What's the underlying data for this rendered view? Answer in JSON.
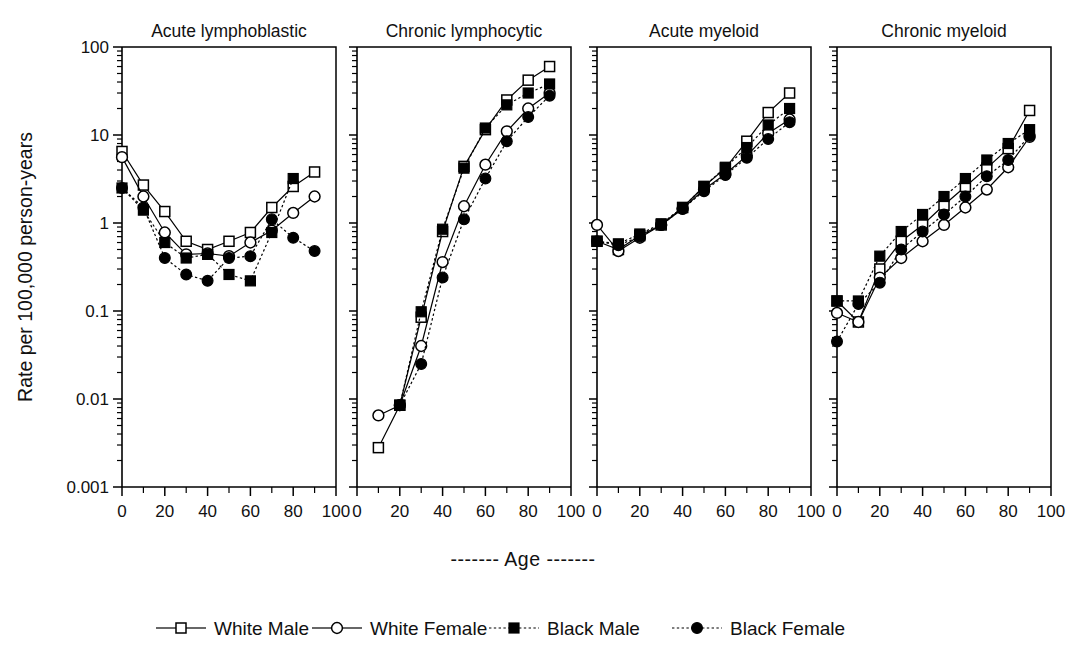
{
  "figure": {
    "y_axis_title": "Rate per 100,000 person-years",
    "x_axis_title": "-------  Age  -------",
    "x_axis_title_plain": "Age"
  },
  "legend": {
    "position": "bottom",
    "items": [
      {
        "label": "White Male",
        "marker": "open-square",
        "line": "solid"
      },
      {
        "label": "White Female",
        "marker": "open-circle",
        "line": "solid"
      },
      {
        "label": "Black Male",
        "marker": "filled-square",
        "line": "dotted"
      },
      {
        "label": "Black Female",
        "marker": "filled-circle",
        "line": "dotted"
      }
    ]
  },
  "axes": {
    "y_tick_labels": [
      "100",
      "10",
      "1",
      "0.1",
      "0.01",
      "0.001"
    ],
    "y_tick_values": [
      100,
      10,
      1,
      0.1,
      0.01,
      0.001
    ],
    "y_scale": "log",
    "ylim": [
      0.001,
      100
    ],
    "x_tick_labels": [
      "0",
      "20",
      "40",
      "60",
      "80",
      "100"
    ],
    "x_tick_values": [
      0,
      20,
      40,
      60,
      80,
      100
    ],
    "x_minor_step": 10,
    "xlim": [
      0,
      100
    ],
    "grid": false
  },
  "chart_data": {
    "type": "line",
    "title": "",
    "subtitle": "",
    "xlabel": "Age",
    "ylabel": "Rate per 100,000 person-years",
    "yscale": "log",
    "ylim": [
      0.001,
      100
    ],
    "xlim": [
      0,
      100
    ],
    "grid": false,
    "legend_position": "bottom",
    "legend_entries": [
      "White Male",
      "White Female",
      "Black Male",
      "Black Female"
    ],
    "x": [
      0,
      10,
      20,
      30,
      40,
      50,
      60,
      70,
      80,
      90
    ],
    "panels": [
      {
        "title": "Acute lymphoblastic",
        "series": [
          {
            "name": "White Male",
            "marker": "open-square",
            "line": "solid",
            "values": [
              6.5,
              2.7,
              1.35,
              0.62,
              0.5,
              0.62,
              0.78,
              1.5,
              2.6,
              3.8
            ]
          },
          {
            "name": "White Female",
            "marker": "open-circle",
            "line": "solid",
            "values": [
              5.6,
              2.0,
              0.78,
              0.44,
              0.45,
              0.42,
              0.6,
              0.82,
              1.3,
              2.0
            ]
          },
          {
            "name": "Black Male",
            "marker": "filled-square",
            "line": "dotted",
            "values": [
              2.5,
              1.4,
              0.6,
              0.4,
              0.44,
              0.26,
              0.22,
              0.78,
              3.2,
              null
            ]
          },
          {
            "name": "Black Female",
            "marker": "filled-circle",
            "line": "dotted",
            "values": [
              2.5,
              1.5,
              0.4,
              0.26,
              0.22,
              0.4,
              0.42,
              1.1,
              0.68,
              0.48
            ]
          }
        ]
      },
      {
        "title": "Chronic lymphocytic",
        "series": [
          {
            "name": "White Male",
            "marker": "open-square",
            "line": "solid",
            "values": [
              null,
              0.0028,
              0.0085,
              0.085,
              0.8,
              4.4,
              11.5,
              25,
              42,
              60
            ]
          },
          {
            "name": "White Female",
            "marker": "open-circle",
            "line": "solid",
            "values": [
              null,
              0.0065,
              0.0085,
              0.04,
              0.36,
              1.55,
              4.6,
              11,
              20,
              30
            ]
          },
          {
            "name": "Black Male",
            "marker": "filled-square",
            "line": "dotted",
            "values": [
              null,
              null,
              0.0085,
              0.098,
              0.85,
              4.2,
              12,
              22,
              30,
              38
            ]
          },
          {
            "name": "Black Female",
            "marker": "filled-circle",
            "line": "dotted",
            "values": [
              null,
              null,
              0.0085,
              0.025,
              0.24,
              1.1,
              3.2,
              8.5,
              16,
              28
            ]
          }
        ]
      },
      {
        "title": "Acute myeloid",
        "series": [
          {
            "name": "White Male",
            "marker": "open-square",
            "line": "solid",
            "values": [
              0.62,
              0.5,
              0.72,
              0.95,
              1.5,
              2.6,
              4.2,
              8.5,
              18,
              30
            ]
          },
          {
            "name": "White Female",
            "marker": "open-circle",
            "line": "solid",
            "values": [
              0.95,
              0.48,
              0.68,
              0.95,
              1.45,
              2.4,
              3.6,
              5.8,
              10.5,
              15
            ]
          },
          {
            "name": "Black Male",
            "marker": "filled-square",
            "line": "dotted",
            "values": [
              0.62,
              0.58,
              0.75,
              0.98,
              1.5,
              2.6,
              4.3,
              7.2,
              13,
              20
            ]
          },
          {
            "name": "Black Female",
            "marker": "filled-circle",
            "line": "dotted",
            "values": [
              0.62,
              0.56,
              0.7,
              0.95,
              1.45,
              2.3,
              3.5,
              5.5,
              9.0,
              14
            ]
          }
        ]
      },
      {
        "title": "Chronic myeloid",
        "series": [
          {
            "name": "White Male",
            "marker": "open-square",
            "line": "solid",
            "values": [
              0.13,
              0.075,
              0.3,
              0.62,
              0.95,
              1.6,
              2.6,
              4.2,
              7.0,
              19
            ]
          },
          {
            "name": "White Female",
            "marker": "open-circle",
            "line": "solid",
            "values": [
              0.095,
              0.075,
              0.24,
              0.4,
              0.62,
              0.95,
              1.5,
              2.4,
              4.3,
              9.5
            ]
          },
          {
            "name": "Black Male",
            "marker": "filled-square",
            "line": "dotted",
            "values": [
              0.13,
              0.13,
              0.42,
              0.8,
              1.25,
              2.0,
              3.2,
              5.2,
              8.0,
              11.5
            ]
          },
          {
            "name": "Black Female",
            "marker": "filled-circle",
            "line": "dotted",
            "values": [
              0.045,
              0.12,
              0.21,
              0.5,
              0.8,
              1.25,
              2.0,
              3.4,
              5.2,
              9.8
            ]
          }
        ]
      }
    ]
  }
}
